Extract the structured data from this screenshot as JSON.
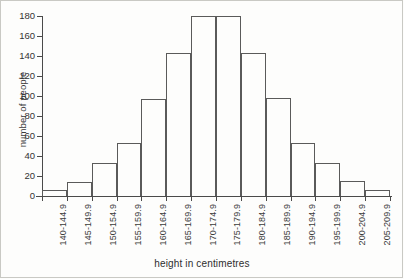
{
  "chart_data": {
    "type": "bar",
    "title": "",
    "subtitle": "",
    "xlabel": "height in centimetres",
    "ylabel": "number of people",
    "categories": [
      "140-144.9",
      "145-149.9",
      "150-154.9",
      "155-159.9",
      "160-164.9",
      "165-169.9",
      "170-174.9",
      "175-179.9",
      "180-184.9",
      "185-189.9",
      "190-194.9",
      "195-199.9",
      "200-204.9",
      "205-209.9"
    ],
    "values": [
      6,
      14,
      33,
      53,
      97,
      143,
      180,
      180,
      143,
      98,
      53,
      33,
      15,
      6
    ],
    "ylim": [
      0,
      180
    ],
    "xlim_note": "14 contiguous 5 cm bins from 140 cm to 209.9 cm",
    "ytick_labels": [
      "0",
      "20",
      "40",
      "60",
      "80",
      "100",
      "120",
      "140",
      "160",
      "180"
    ],
    "ytick_values": [
      0,
      20,
      40,
      60,
      80,
      100,
      120,
      140,
      160,
      180
    ],
    "grid": false,
    "legend": false,
    "legend_position": "none",
    "bar_style": "outlined-unfilled",
    "colors": {
      "bar_outline": "#5a5a5a",
      "bar_fill": "transparent",
      "axis": "#4a4a4a",
      "text": "#333333",
      "background": "#fdfdfc",
      "figure_border": "#c9c9c4"
    }
  },
  "axes": {
    "y_title": "number of people",
    "x_title": "height in centimetres"
  }
}
